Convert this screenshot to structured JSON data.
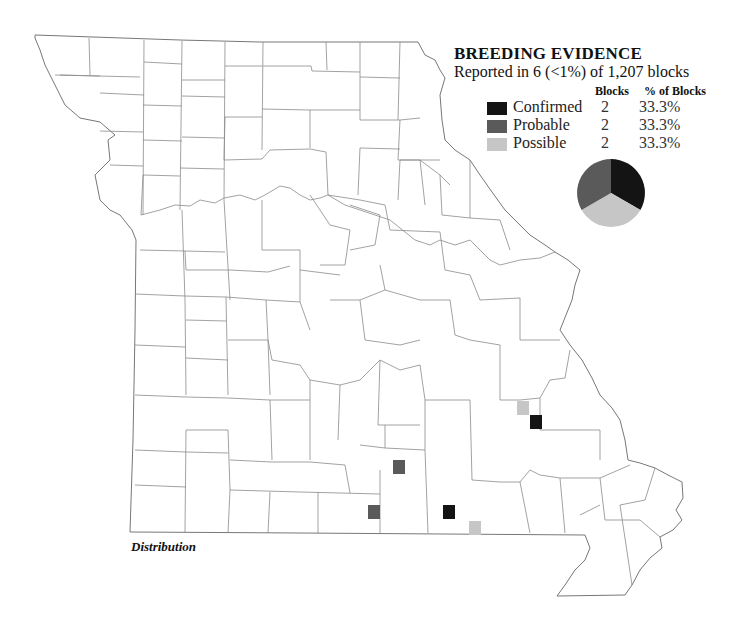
{
  "legend": {
    "title": "BREEDING EVIDENCE",
    "subtitle": "Reported in 6 (<1%) of 1,207 blocks",
    "col_blocks": "Blocks",
    "col_pct": "% of Blocks",
    "rows": [
      {
        "label": "Confirmed",
        "blocks": "2",
        "pct": "33.3%",
        "color": "#141414"
      },
      {
        "label": "Probable",
        "blocks": "2",
        "pct": "33.3%",
        "color": "#5a5a5a"
      },
      {
        "label": "Possible",
        "blocks": "2",
        "pct": "33.3%",
        "color": "#c6c6c6"
      }
    ]
  },
  "caption": "Distribution",
  "chart_data": {
    "type": "pie",
    "title": "BREEDING EVIDENCE",
    "categories": [
      "Confirmed",
      "Probable",
      "Possible"
    ],
    "values": [
      2,
      2,
      2
    ],
    "percent": [
      33.3,
      33.3,
      33.3
    ],
    "colors": [
      "#141414",
      "#5a5a5a",
      "#c6c6c6"
    ],
    "total_blocks": 1207,
    "reported_blocks": 6
  },
  "markers": [
    {
      "category": "Possible",
      "x": 517,
      "y": 401
    },
    {
      "category": "Confirmed",
      "x": 530,
      "y": 415
    },
    {
      "category": "Probable",
      "x": 393,
      "y": 460
    },
    {
      "category": "Probable",
      "x": 368,
      "y": 505
    },
    {
      "category": "Confirmed",
      "x": 443,
      "y": 505
    },
    {
      "category": "Possible",
      "x": 469,
      "y": 521
    }
  ]
}
